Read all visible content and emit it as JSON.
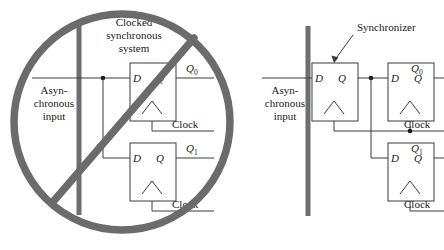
{
  "figure": {
    "name": "synchronizer-figure",
    "colors": {
      "wire": "#3b3b3b",
      "text": "#1a1a1a",
      "ban_circle": "#6b6b6b",
      "boundary_bar": "#6e6e6e",
      "box_fill": "#ffffff",
      "background": "#ffffff"
    }
  },
  "left_diagram": {
    "name": "bad-practice-diagram",
    "banned": true,
    "ban_symbol": "circle-with-slash",
    "title": {
      "line1": "Clocked",
      "line2": "synchronous",
      "line3": "system"
    },
    "input_label": {
      "line1": "Asyn-",
      "line2": "chronous",
      "line3": "input"
    },
    "flipflops": [
      {
        "name": "flipflop-q0",
        "d_pin": "D",
        "q_pin": "Q",
        "output_label": "Q",
        "output_sub": "0",
        "clock_label": "Clock",
        "edge_trigger": "rising-edge-triangle"
      },
      {
        "name": "flipflop-q1",
        "d_pin": "D",
        "q_pin": "Q",
        "output_label": "Q",
        "output_sub": "1",
        "clock_label": "Clock",
        "edge_trigger": "rising-edge-triangle"
      }
    ],
    "junction_dots": 1
  },
  "right_diagram": {
    "name": "good-practice-diagram",
    "banned": false,
    "annotation": {
      "label": "Synchronizer",
      "pointer": "arrow-to-first-flipflop"
    },
    "input_label": {
      "line1": "Asyn-",
      "line2": "chronous",
      "line3": "input"
    },
    "flipflops": [
      {
        "name": "flipflop-synchronizer",
        "d_pin": "D",
        "q_pin": "Q",
        "output_label": "",
        "output_sub": "",
        "clock_label": "",
        "edge_trigger": "rising-edge-triangle"
      },
      {
        "name": "flipflop-q0",
        "d_pin": "D",
        "q_pin": "Q",
        "output_label": "Q",
        "output_sub": "0",
        "clock_label": "Clock",
        "edge_trigger": "rising-edge-triangle"
      },
      {
        "name": "flipflop-q1",
        "d_pin": "D",
        "q_pin": "Q",
        "output_label": "Q",
        "output_sub": "1",
        "clock_label": "Clock",
        "edge_trigger": "rising-edge-triangle"
      }
    ],
    "junction_dots": 3
  }
}
